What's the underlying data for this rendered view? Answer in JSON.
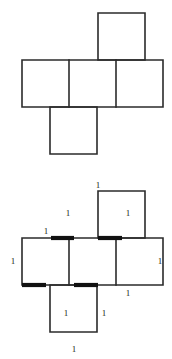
{
  "page": {
    "background_color": "#ffffff",
    "width": 172,
    "height": 359
  },
  "style": {
    "line_color": "#2b2b2b",
    "bold_line_color": "#111111",
    "face_fill": "#ffffff",
    "label_color": "#1a1a1a",
    "line_width": 1.6,
    "bold_line_width": 4.2
  },
  "figures": [
    {
      "id": "figure-top",
      "name": "cube-net-unlabeled",
      "type": "cube-net",
      "description": "Unfolded cube net of six unit squares in a cross arrangement",
      "square_size": 47,
      "origin": {
        "x": 22,
        "y": 13
      },
      "faces": [
        {
          "name": "face-top",
          "col": 2,
          "row": 0
        },
        {
          "name": "face-left",
          "col": 0,
          "row": 1
        },
        {
          "name": "face-front",
          "col": 1,
          "row": 1
        },
        {
          "name": "face-right",
          "col": 2,
          "row": 1
        },
        {
          "name": "face-bottom",
          "col": 1,
          "row": 2
        }
      ],
      "labels": []
    },
    {
      "id": "figure-bottom",
      "name": "cube-net-labeled",
      "type": "cube-net",
      "description": "Same cube net with each edge labeled 1 and folding seams drawn bold",
      "square_size": 47,
      "origin": {
        "x": 22,
        "y": 13
      },
      "faces": [
        {
          "name": "face-top",
          "col": 2,
          "row": 0
        },
        {
          "name": "face-left",
          "col": 0,
          "row": 1
        },
        {
          "name": "face-front",
          "col": 1,
          "row": 1
        },
        {
          "name": "face-right",
          "col": 2,
          "row": 1
        },
        {
          "name": "face-bottom",
          "col": 1,
          "row": 2
        }
      ],
      "bold_edges": [
        {
          "name": "seam-top-front",
          "x1": 51,
          "y1": 60,
          "x2": 74,
          "y2": 60
        },
        {
          "name": "seam-top-right",
          "x1": 98,
          "y1": 60,
          "x2": 122,
          "y2": 60
        },
        {
          "name": "seam-bottom-left",
          "x1": 22,
          "y1": 107,
          "x2": 46,
          "y2": 107
        },
        {
          "name": "seam-bottom-front",
          "x1": 74,
          "y1": 107,
          "x2": 98,
          "y2": 107
        }
      ],
      "labels": [
        {
          "name": "label-top-top",
          "value": "1",
          "x": 98,
          "y": 8
        },
        {
          "name": "label-top-left",
          "value": "1",
          "x": 68,
          "y": 36
        },
        {
          "name": "label-top-right",
          "value": "1",
          "x": 128,
          "y": 36
        },
        {
          "name": "label-left-top",
          "value": "1",
          "x": 46,
          "y": 54
        },
        {
          "name": "label-left-left",
          "value": "1",
          "x": 13,
          "y": 84
        },
        {
          "name": "label-right-right",
          "value": "1",
          "x": 160,
          "y": 84
        },
        {
          "name": "label-right-bottom",
          "value": "1",
          "x": 128,
          "y": 116
        },
        {
          "name": "label-bottom-left",
          "value": "1",
          "x": 66,
          "y": 136
        },
        {
          "name": "label-bottom-right",
          "value": "1",
          "x": 104,
          "y": 136
        },
        {
          "name": "label-bottom-bottom",
          "value": "1",
          "x": 74,
          "y": 172
        }
      ]
    }
  ]
}
